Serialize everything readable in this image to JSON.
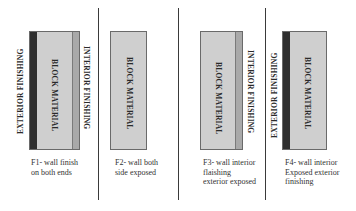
{
  "colors": {
    "exterior_finishing": "#2f2f2f",
    "block_material": "#cfcfcf",
    "interior_finishing": "#a9a9a9",
    "divider": "#3a3a3a",
    "background": "#ffffff"
  },
  "panels": [
    {
      "id": "F1",
      "labels": {
        "exterior": "EXTERIOR FINISHING",
        "block": "BLOCK MATERIAL",
        "interior": "INTERIOR FINISHING"
      },
      "caption": [
        "F1- wall finish",
        "on both ends"
      ]
    },
    {
      "id": "F2",
      "labels": {
        "block": "BLOCK MATERIAL"
      },
      "caption": [
        "F2- wall both",
        "side exposed"
      ]
    },
    {
      "id": "F3",
      "labels": {
        "block": "BLOCK MATERIAL",
        "interior": "INTERIOR FINISHING"
      },
      "caption": [
        "F3- wall interior",
        "flaishing",
        "exterior exposed"
      ]
    },
    {
      "id": "F4",
      "labels": {
        "exterior": "EXTERIOR FINISHING",
        "block": "BLOCK MATERIAL"
      },
      "caption": [
        "F4- wall interior",
        "Exposed exterior",
        "finishing"
      ]
    }
  ]
}
